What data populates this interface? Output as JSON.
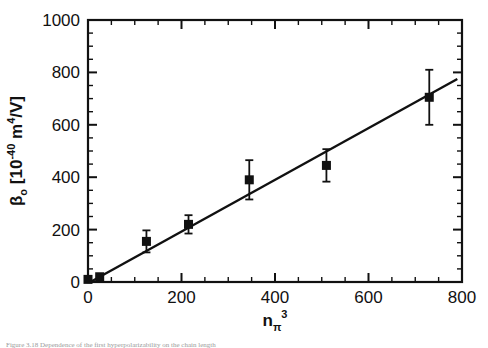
{
  "figure": {
    "background_color": "#ffffff",
    "ink_color": "#111111",
    "caption_fragment": "Figure 3.18 Dependence of the first hyperpolarizability on the chain length"
  },
  "chart_data": {
    "type": "scatter",
    "title": "",
    "xlabel": "n_pi^3",
    "xlabel_parts": {
      "base": "n",
      "sub": "π",
      "sup": "3"
    },
    "ylabel": "βo [10-40 m4/V]",
    "ylabel_parts": {
      "symbol": "β",
      "symbol_sub": "o",
      "bracket_open": " [10",
      "exp1": "-40",
      "mid": " m",
      "exp2": "4",
      "tail": "/V]"
    },
    "xlim": [
      0,
      800
    ],
    "ylim": [
      0,
      1000
    ],
    "xticks": [
      0,
      200,
      400,
      600,
      800
    ],
    "yticks": [
      0,
      200,
      400,
      600,
      800,
      1000
    ],
    "xtick_labels": [
      "0",
      "200",
      "400",
      "600",
      "800"
    ],
    "ytick_labels": [
      "0",
      "200",
      "400",
      "600",
      "800",
      "1000"
    ],
    "x_minor_step": 50,
    "y_minor_step": 50,
    "grid": false,
    "legend": null,
    "frame": "box",
    "tick_direction": "in",
    "marker": "filled-square",
    "marker_color": "#111111",
    "series": [
      {
        "name": "measured hyperpolarizability",
        "x": [
          0,
          25,
          125,
          215,
          345,
          510,
          730
        ],
        "y": [
          10,
          20,
          155,
          220,
          390,
          445,
          705
        ],
        "yerr": [
          0,
          0,
          42,
          35,
          75,
          62,
          105
        ]
      }
    ],
    "fit_line": {
      "name": "linear fit",
      "x": [
        5,
        790
      ],
      "y": [
        0,
        775
      ],
      "color": "#111111"
    }
  }
}
